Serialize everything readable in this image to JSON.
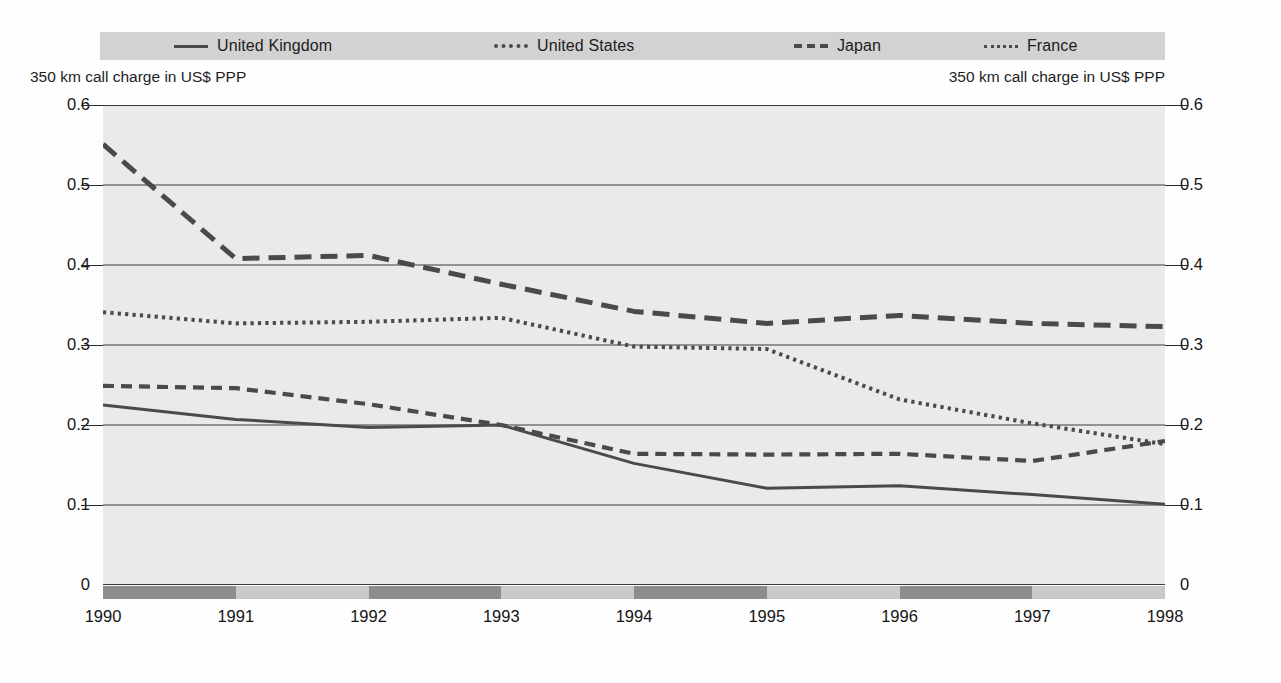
{
  "legend": {
    "items": [
      {
        "label": "United Kingdom",
        "style": "solid",
        "key_icon": "line-solid-icon"
      },
      {
        "label": "United States",
        "style": "dotted",
        "key_icon": "line-dotted-icon"
      },
      {
        "label": "Japan",
        "style": "dashed",
        "key_icon": "line-dashed-icon"
      },
      {
        "label": "France",
        "style": "fine",
        "key_icon": "line-fine-dotted-icon"
      }
    ]
  },
  "axis_caption_left": "350 km call charge in US$ PPP",
  "axis_caption_right": "350 km call charge in US$ PPP",
  "ticks": {
    "y": [
      "0.6",
      "0.5",
      "0.4",
      "0.3",
      "0.2",
      "0.1",
      "0"
    ],
    "x": [
      "1990",
      "1991",
      "1992",
      "1993",
      "1994",
      "1995",
      "1996",
      "1997",
      "1998"
    ]
  },
  "colors": {
    "plot_background": "#eaeaea",
    "legend_background": "#d2d2d2",
    "series_line": "#4a4a4a",
    "gridline": "#3a3a3a",
    "band_light": "#c9c9c9",
    "band_dark": "#8d8d8d",
    "text": "#141414"
  },
  "page_bleed": [
    {
      "text": "in the 1990s. The total international call revenue",
      "x": 470,
      "y": 104,
      "size": 16
    },
    {
      "text": "has passed to a different carrier than the originator but",
      "x": 620,
      "y": 124,
      "size": 16
    },
    {
      "text": "Japan, where OECD or growing liberalisation has proved",
      "x": 620,
      "y": 148,
      "size": 16
    },
    {
      "text": "remain in the hands of the carriers still dominate the",
      "x": 620,
      "y": 172,
      "size": 16
    },
    {
      "text": "1998. Thus, even if revenue has dropped over the same period, the",
      "x": 620,
      "y": 196,
      "size": 16
    },
    {
      "text": "The proportion of the revenue to the number of minutes",
      "x": 620,
      "y": 228,
      "size": 16
    },
    {
      "text": "telephones",
      "x": 590,
      "y": 372,
      "size": 19
    },
    {
      "text": "...and international call price",
      "x": 240,
      "y": 430,
      "size": 17
    },
    {
      "text": "fall in telecommunications costs that in the US, which combine",
      "x": 180,
      "y": 452,
      "size": 16
    },
    {
      "text": "that the Nordic countries have seen a faster rate than in the",
      "x": 180,
      "y": 474,
      "size": 16
    },
    {
      "text": "for the speed both national and regional. OECD mobile",
      "x": 180,
      "y": 496,
      "size": 16
    },
    {
      "text": "Denmark and Sweden for lines that were well above twice the",
      "x": 180,
      "y": 518,
      "size": 16
    },
    {
      "text": "rapidly reduced in relative terms. In all of these",
      "x": 180,
      "y": 540,
      "size": 16
    }
  ],
  "chart_data": {
    "type": "line",
    "title": "",
    "xlabel": "",
    "ylabel": "350 km call charge in US$ PPP",
    "xlim": [
      1990,
      1998
    ],
    "ylim": [
      0,
      0.6
    ],
    "yticks": [
      0,
      0.1,
      0.2,
      0.3,
      0.4,
      0.5,
      0.6
    ],
    "grid": true,
    "legend_position": "top",
    "x": [
      1990,
      1991,
      1992,
      1993,
      1994,
      1995,
      1996,
      1997,
      1998
    ],
    "series": [
      {
        "name": "United Kingdom",
        "style": "solid",
        "values": [
          0.225,
          0.207,
          0.197,
          0.2,
          0.152,
          0.121,
          0.124,
          0.113,
          0.101
        ]
      },
      {
        "name": "United States",
        "style": "dotted",
        "values": [
          0.249,
          0.246,
          0.226,
          0.2,
          0.164,
          0.163,
          0.164,
          0.155,
          0.18
        ]
      },
      {
        "name": "Japan",
        "style": "dashed",
        "values": [
          0.551,
          0.408,
          0.412,
          0.376,
          0.342,
          0.327,
          0.337,
          0.327,
          0.323
        ]
      },
      {
        "name": "France",
        "style": "fine-dotted",
        "values": [
          0.341,
          0.327,
          0.329,
          0.334,
          0.298,
          0.295,
          0.232,
          0.202,
          0.176
        ]
      }
    ]
  }
}
